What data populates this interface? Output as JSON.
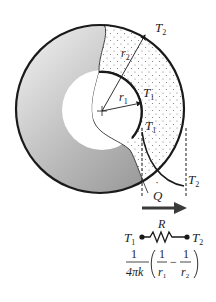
{
  "diagram": {
    "labels": {
      "T2_outer": "T",
      "T2_outer_sub": "2",
      "r2": "r",
      "r2_sub": "2",
      "r1": "r",
      "r1_sub": "1",
      "T1_inner": "T",
      "T1_inner_sub": "1",
      "T1_profile": "T",
      "T1_profile_sub": "1",
      "T2_profile": "T",
      "T2_profile_sub": "2",
      "heat_rate": "Q",
      "heat_rate_dot": "˙"
    },
    "resistance_network": {
      "resistor_label": "R",
      "left_node": "T",
      "left_node_sub": "1",
      "right_node": "T",
      "right_node_sub": "2",
      "formula_prefix_num": "1",
      "formula_prefix_den": "4πk",
      "term1_num": "1",
      "term1_den": "r",
      "term1_den_sub": "1",
      "minus": "−",
      "term2_num": "1",
      "term2_den": "r",
      "term2_den_sub": "2"
    },
    "colors": {
      "stroke": "#1a1a1a",
      "gradient_dark": "#8a8a8a",
      "gradient_light": "#f2f2f2",
      "dots": "#888888"
    }
  }
}
